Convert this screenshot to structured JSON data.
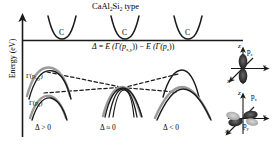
{
  "figure": {
    "title": "CaAl2Si2 type",
    "title_parts": {
      "pre": "CaAl",
      "sub1": "2",
      "mid": "Si",
      "sub2": "2",
      "post": " type"
    },
    "axis": {
      "y_label": "Energy (eV)"
    },
    "equation": {
      "delta": "Δ",
      "equals": " = ",
      "term1": "E (Γ(p",
      "term1_sub": "x,y",
      "term1_end": "))",
      "minus": " − ",
      "term2": "E (Γ(p",
      "term2_sub": "z",
      "term2_end": "))"
    },
    "conduction_band_label": "C",
    "conduction_bands": [
      {
        "label": "C",
        "cx": 62
      },
      {
        "label": "C",
        "cx": 125
      },
      {
        "label": "C",
        "cx": 188
      }
    ],
    "valence_labels": {
      "pxy": {
        "gamma": "Γ(p",
        "sub": "x,y",
        "end": ")"
      },
      "pz": {
        "gamma": "Γ(p",
        "sub": "z",
        "end": ")"
      }
    },
    "panels": [
      {
        "id": "panel-delta-positive",
        "delta_label": "Δ > 0",
        "cx": 55
      },
      {
        "id": "panel-delta-zero",
        "delta_label": "Δ ≈ 0",
        "cx": 120
      },
      {
        "id": "panel-delta-negative",
        "delta_label": "Δ < 0",
        "cx": 182
      }
    ],
    "orbitals": [
      {
        "id": "orbital-pz",
        "label": "p",
        "label_sub": "z",
        "axes": {
          "x": "x",
          "y": "y",
          "z": "z"
        }
      },
      {
        "id": "orbital-pxpy",
        "label_x": "p",
        "label_x_sub": "x",
        "label_y": "p",
        "label_y_sub": "y",
        "axes": {
          "x": "x",
          "y": "y",
          "z": "z"
        }
      }
    ],
    "colors": {
      "line": "#1a1a1a",
      "band_gray": "#9a9a9a",
      "orbital_dark": "#2b2b2b",
      "orbital_light": "#b0b0b0",
      "background": "#ffffff"
    }
  }
}
